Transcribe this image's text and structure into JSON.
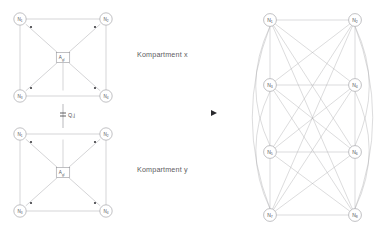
{
  "figure": {
    "background_color": "#ffffff",
    "line_color": "#a9a9ad",
    "text_color": "#5d5d61",
    "accent_color": "#2a2a2e"
  },
  "labels": {
    "kompartment_x": "Kompartment  x",
    "kompartment_y": "Kompartment  y",
    "exchange_flow": "Q,j"
  },
  "compartment_x": {
    "name": "Kompartment x",
    "center_box": {
      "label": "A",
      "subscript": "gl"
    },
    "nodes": [
      {
        "id": "x-n1",
        "label": "N",
        "subscript": "1",
        "cx": 20,
        "cy": 19,
        "r": 6.2,
        "corner": "top-left"
      },
      {
        "id": "x-n2",
        "label": "N",
        "subscript": "2",
        "cx": 106,
        "cy": 19,
        "r": 6.2,
        "corner": "top-right"
      },
      {
        "id": "x-n3",
        "label": "N",
        "subscript": "3",
        "cx": 20,
        "cy": 96,
        "r": 6.2,
        "corner": "bottom-left"
      },
      {
        "id": "x-n4",
        "label": "N",
        "subscript": "4",
        "cx": 106,
        "cy": 96,
        "r": 6.2,
        "corner": "bottom-right"
      }
    ],
    "inner_dots": [
      {
        "cx": 31,
        "cy": 27
      },
      {
        "cx": 95,
        "cy": 27
      },
      {
        "cx": 31,
        "cy": 88
      },
      {
        "cx": 95,
        "cy": 88
      }
    ],
    "dot_labels": [
      "a",
      "a",
      "a",
      "a"
    ]
  },
  "compartment_y": {
    "name": "Kompartment y",
    "center_box": {
      "label": "A",
      "subscript": "gl"
    },
    "nodes": [
      {
        "id": "y-n1",
        "label": "N",
        "subscript": "1",
        "cx": 20,
        "cy": 134,
        "r": 6.2,
        "corner": "top-left"
      },
      {
        "id": "y-n2",
        "label": "N",
        "subscript": "2",
        "cx": 106,
        "cy": 134,
        "r": 6.2,
        "corner": "top-right"
      },
      {
        "id": "y-n3",
        "label": "N",
        "subscript": "3",
        "cx": 20,
        "cy": 211,
        "r": 6.2,
        "corner": "bottom-left"
      },
      {
        "id": "y-n4",
        "label": "N",
        "subscript": "4",
        "cx": 106,
        "cy": 211,
        "r": 6.2,
        "corner": "bottom-right"
      }
    ],
    "inner_dots": [
      {
        "cx": 31,
        "cy": 142
      },
      {
        "cx": 95,
        "cy": 142
      },
      {
        "cx": 31,
        "cy": 203
      },
      {
        "cx": 95,
        "cy": 203
      }
    ],
    "dot_labels": [
      "a",
      "a",
      "a",
      "a"
    ]
  },
  "transform_arrow": {
    "shape": "right-triangle",
    "x": 211,
    "y": 113,
    "size": 6
  },
  "graph_k8": {
    "type": "complete-graph",
    "node_count": 8,
    "edge_count": 28,
    "description": "Vollstaendiger Graph K8 aus acht Knoten, alle Paare verbunden",
    "nodes": [
      {
        "id": "g-n1",
        "label": "N",
        "subscript": "1",
        "cx": 270,
        "cy": 20,
        "r": 6.4
      },
      {
        "id": "g-n2",
        "label": "N",
        "subscript": "2",
        "cx": 355,
        "cy": 20,
        "r": 6.4
      },
      {
        "id": "g-n3",
        "label": "N",
        "subscript": "3",
        "cx": 270,
        "cy": 85,
        "r": 6.4
      },
      {
        "id": "g-n4",
        "label": "N",
        "subscript": "4",
        "cx": 355,
        "cy": 85,
        "r": 6.4
      },
      {
        "id": "g-n5",
        "label": "N",
        "subscript": "5",
        "cx": 270,
        "cy": 152,
        "r": 6.4
      },
      {
        "id": "g-n6",
        "label": "N",
        "subscript": "6",
        "cx": 355,
        "cy": 152,
        "r": 6.4
      },
      {
        "id": "g-n7",
        "label": "N",
        "subscript": "7",
        "cx": 270,
        "cy": 215,
        "r": 6.4
      },
      {
        "id": "g-n8",
        "label": "N",
        "subscript": "8",
        "cx": 355,
        "cy": 215,
        "r": 6.4
      }
    ],
    "curved_edge_pairs": [
      [
        "g-n1",
        "g-n5"
      ],
      [
        "g-n1",
        "g-n7"
      ],
      [
        "g-n3",
        "g-n7"
      ],
      [
        "g-n2",
        "g-n6"
      ],
      [
        "g-n2",
        "g-n8"
      ],
      [
        "g-n4",
        "g-n8"
      ]
    ]
  }
}
